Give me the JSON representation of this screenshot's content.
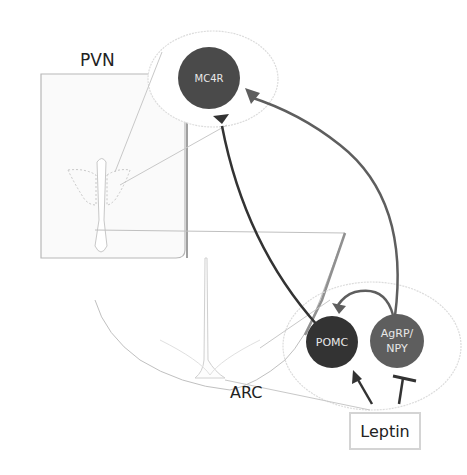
{
  "diagram": {
    "regions": [
      {
        "id": "pvn",
        "label": "PVN"
      },
      {
        "id": "arc",
        "label": "ARC"
      }
    ],
    "nodes": [
      {
        "id": "mc4r",
        "label": "MC4R",
        "color": "#4a4a4a"
      },
      {
        "id": "pomc",
        "label": "POMC",
        "color": "#333333"
      },
      {
        "id": "agrp",
        "label_line1": "AgRP/",
        "label_line2": "NPY",
        "color": "#5e5e5e"
      }
    ],
    "input": {
      "id": "leptin",
      "label": "Leptin"
    },
    "edges": [
      {
        "from": "pomc",
        "to": "mc4r",
        "type": "synapse",
        "color": "#333333"
      },
      {
        "from": "agrp",
        "to": "mc4r",
        "type": "synapse",
        "color": "#5e5e5e"
      },
      {
        "from": "agrp",
        "to": "pomc",
        "type": "synapse",
        "color": "#5e5e5e"
      },
      {
        "from": "leptin",
        "to": "pomc",
        "type": "activation-arrow"
      },
      {
        "from": "leptin",
        "to": "agrp",
        "type": "inhibition-bar"
      }
    ],
    "colors": {
      "outline_light": "#c8c8c8",
      "outline_gray": "#9a9a9a",
      "text": "#222222"
    }
  }
}
